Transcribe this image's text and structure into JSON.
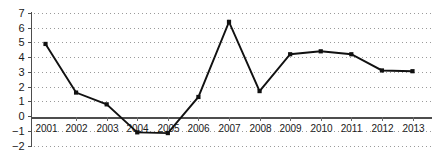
{
  "chart_data": {
    "type": "line",
    "title": "",
    "subtitle": "",
    "xlabel": "",
    "ylabel": "",
    "categories": [
      "2001",
      "2002",
      "2003",
      "2004",
      "2005",
      "2006",
      "2007",
      "2008",
      "2009",
      "2010",
      "2011",
      "2012",
      "2013"
    ],
    "values": [
      4.9,
      1.6,
      0.8,
      -1.1,
      -1.15,
      1.3,
      6.4,
      1.7,
      4.2,
      4.4,
      4.2,
      3.1,
      3.05
    ],
    "series": [
      {
        "name": "",
        "values": [
          4.9,
          1.6,
          0.8,
          -1.1,
          -1.15,
          1.3,
          6.4,
          1.7,
          4.2,
          4.4,
          4.2,
          3.1,
          3.05
        ]
      }
    ],
    "ylim": [
      -2,
      7
    ],
    "xlim": [
      2001,
      2013
    ],
    "ytick_labels": [
      "7",
      "6",
      "5",
      "4",
      "3",
      "2",
      "1",
      "0",
      "−1",
      "−2"
    ],
    "ytick_values": [
      7,
      6,
      5,
      4,
      3,
      2,
      1,
      0,
      -1,
      -2
    ],
    "xtick_labels": [
      "2001",
      "2002",
      "2003",
      "2004",
      "2005",
      "2006",
      "2007",
      "2008",
      "2009",
      "2010",
      "2011",
      "2012",
      "2013"
    ],
    "grid": true,
    "grid_style": "dotted-horizontal",
    "legend": false,
    "legend_position": "none",
    "marker": "square",
    "annotations": []
  },
  "colors": {
    "line": "#111111",
    "marker": "#111111",
    "grid": "#9a9a9a",
    "axis": "#4d4d4d",
    "text": "#1a1a1a",
    "background": "#ffffff"
  }
}
